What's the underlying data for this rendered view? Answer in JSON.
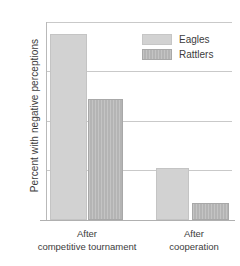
{
  "chart_data": {
    "type": "bar",
    "title": "",
    "xlabel": "",
    "ylabel": "Percent with negative perceptions",
    "categories": [
      "After competitive tournament",
      "After cooperation"
    ],
    "category_lines": [
      [
        "After",
        "competitive tournament"
      ],
      [
        "After",
        "cooperation"
      ]
    ],
    "series": [
      {
        "name": "Eagles",
        "color": "#d2d2d2",
        "values": [
          75,
          21
        ]
      },
      {
        "name": "Rattlers",
        "color": "#b4b4b4",
        "values": [
          49,
          7
        ]
      }
    ],
    "ylim": [
      0,
      80
    ],
    "yticks": [
      0,
      20,
      40,
      60,
      80
    ],
    "ytick_labels": [
      "0",
      "20",
      "40",
      "60",
      "80"
    ],
    "grid": "horizontal",
    "legend_position": "top-right"
  },
  "legend": {
    "items": [
      {
        "label": "Eagles"
      },
      {
        "label": "Rattlers"
      }
    ]
  },
  "axes": {
    "y_title": "Percent with negative perceptions",
    "ticks": [
      "80",
      "60",
      "40",
      "20",
      "0"
    ]
  }
}
